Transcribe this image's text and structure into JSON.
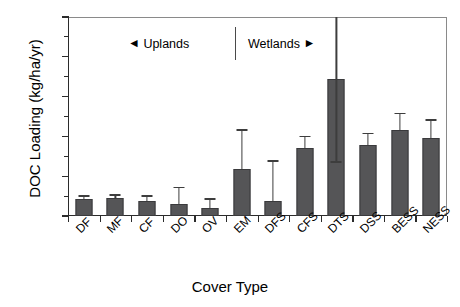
{
  "chart_data": {
    "type": "bar",
    "title": "",
    "subtitle": "",
    "xlabel": "Cover Type",
    "ylabel": "DOC Loading (kg/ha/yr)",
    "ylim": [
      0,
      500
    ],
    "yticks": [
      0,
      100,
      200,
      300,
      400,
      500
    ],
    "ytick_labels": [
      "0",
      "100",
      "200",
      "300",
      "400",
      "500"
    ],
    "y_minor_ticks": [
      50,
      150,
      250,
      350,
      450
    ],
    "grid": false,
    "legend": null,
    "categories": [
      "DF",
      "MF",
      "CF",
      "DO",
      "OV",
      "EM",
      "DFS",
      "CFS",
      "DTS",
      "DSS",
      "BESS",
      "NESS"
    ],
    "values": [
      42,
      46,
      37,
      30,
      20,
      118,
      38,
      171,
      344,
      178,
      216,
      196
    ],
    "error_upper": [
      50,
      53,
      50,
      72,
      43,
      216,
      138,
      199,
      500,
      208,
      257,
      241
    ],
    "error_lower": [
      42,
      46,
      37,
      30,
      20,
      118,
      38,
      171,
      136,
      178,
      216,
      196
    ],
    "error_type": "upper-only-visible",
    "bar_color": "#555557",
    "bar_edge_color": "#3a3a3c",
    "error_color": "#3d3d3d",
    "annotations": [
      {
        "name": "uplands",
        "text": "Uplands",
        "arrow": "◄",
        "arrow_position": "left"
      },
      {
        "name": "wetlands",
        "text": "Wetlands",
        "arrow": "►",
        "arrow_position": "right"
      },
      {
        "name": "divider",
        "text": ""
      }
    ]
  },
  "axes": {
    "y_title": "DOC Loading (kg/ha/yr)",
    "x_title": "Cover Type"
  },
  "annotation": {
    "uplands_arrow": "◄",
    "uplands_text": "Uplands",
    "wetlands_text": "Wetlands",
    "wetlands_arrow": "►"
  }
}
